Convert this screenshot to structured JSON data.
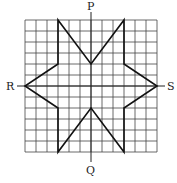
{
  "diagram": {
    "type": "star-on-grid",
    "grid": {
      "cells": 12,
      "origin_px": [
        25,
        20
      ],
      "cell_px": 11,
      "line_color": "#333333"
    },
    "star_vertices_cells": [
      [
        3,
        0
      ],
      [
        6,
        4
      ],
      [
        9,
        0
      ],
      [
        9,
        4
      ],
      [
        12,
        6
      ],
      [
        9,
        8
      ],
      [
        9,
        12
      ],
      [
        6,
        8
      ],
      [
        3,
        12
      ],
      [
        3,
        8
      ],
      [
        0,
        6
      ],
      [
        3,
        4
      ]
    ],
    "axes": {
      "vertical": "PQ",
      "horizontal": "RS"
    },
    "labels": {
      "top": "P",
      "bottom": "Q",
      "left": "R",
      "right": "S"
    }
  }
}
